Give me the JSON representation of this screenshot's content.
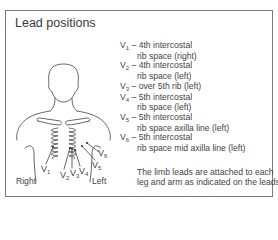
{
  "title": "Lead positions",
  "figure": {
    "side_labels": {
      "right": "Right",
      "left": "Left"
    },
    "electrode_labels": [
      {
        "id": "V1",
        "letter": "V",
        "sub": "1"
      },
      {
        "id": "V2",
        "letter": "V",
        "sub": "2"
      },
      {
        "id": "V3",
        "letter": "V",
        "sub": "3"
      },
      {
        "id": "V4",
        "letter": "V",
        "sub": "4"
      },
      {
        "id": "V5",
        "letter": "V",
        "sub": "5"
      },
      {
        "id": "V6",
        "letter": "V",
        "sub": "6"
      }
    ]
  },
  "leads": [
    {
      "letter": "V",
      "sub": "1",
      "line1": " – 4th intercostal",
      "line2": "rib space (right)"
    },
    {
      "letter": "V",
      "sub": "2",
      "line1": " – 4th intercostal",
      "line2": "rib space (left)"
    },
    {
      "letter": "V",
      "sub": "3",
      "line1": " – over 5th rib (left)",
      "line2": null
    },
    {
      "letter": "V",
      "sub": "4",
      "line1": " – 5th intercostal",
      "line2": "rib space (left)"
    },
    {
      "letter": "V",
      "sub": "5",
      "line1": " – 5th intercostal",
      "line2": "rib space axilla line (left)"
    },
    {
      "letter": "V",
      "sub": "6",
      "line1": " – 5th intercostal",
      "line2": "rib space mid axilla line (left)"
    }
  ],
  "note": {
    "line1": "The limb leads are attached to each",
    "line2": "leg and arm as indicated on the leads"
  },
  "colors": {
    "frame": "#7a7a7a",
    "line": "#555555",
    "text": "#444444"
  }
}
